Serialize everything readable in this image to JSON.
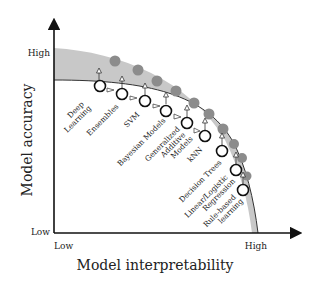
{
  "diagram": {
    "type": "accuracy-vs-interpretability tradeoff",
    "y_axis": {
      "title": "Model accuracy",
      "high_label": "High",
      "low_label": "Low"
    },
    "x_axis": {
      "title": "Model interpretability",
      "low_label": "Low",
      "high_label": "High"
    },
    "colors": {
      "band": "#c8c8c8",
      "filled_marker": "#8c8c8c",
      "axis": "#111111",
      "hollow_marker_fill": "#ffffff"
    },
    "models": [
      {
        "label_lines": [
          "Deep",
          "Learning"
        ]
      },
      {
        "label_lines": [
          "Ensembles"
        ]
      },
      {
        "label_lines": [
          "SVM"
        ]
      },
      {
        "label_lines": [
          "Bayesian Models"
        ]
      },
      {
        "label_lines": [
          "Generalized",
          "Additive",
          "Models"
        ]
      },
      {
        "label_lines": [
          "kNN"
        ]
      },
      {
        "label_lines": [
          "Decision Trees"
        ]
      },
      {
        "label_lines": [
          "Linear/Logistic",
          "Regression"
        ]
      },
      {
        "label_lines": [
          "Rule-based",
          "learning"
        ]
      }
    ]
  }
}
